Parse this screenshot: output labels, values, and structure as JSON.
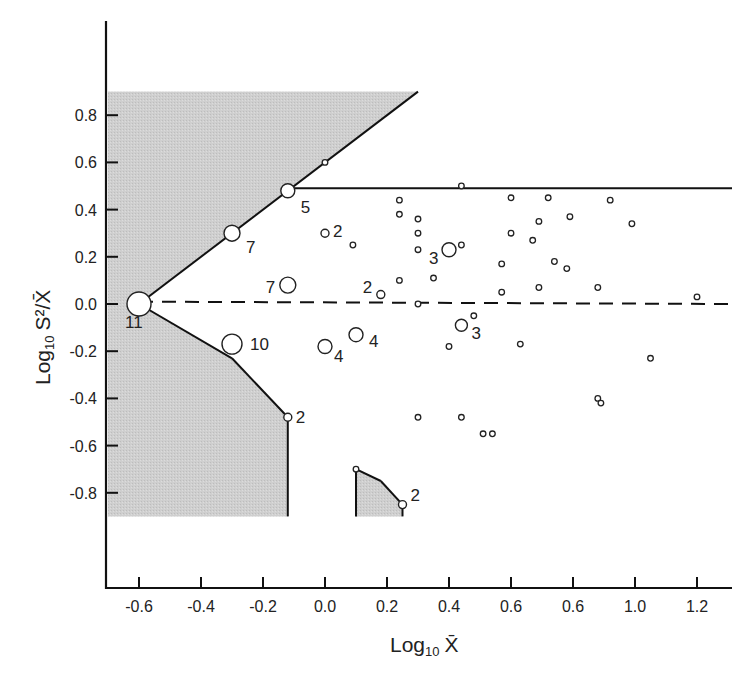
{
  "chart_data": {
    "type": "scatter",
    "title": "",
    "xlabel": "Log10 X̄",
    "ylabel": "Log10 S²/X̄",
    "xlabel_parts": {
      "main": "Log",
      "sub": "10",
      "var": "X̄"
    },
    "ylabel_parts": {
      "main": "Log",
      "sub": "10",
      "var": "S²/X̄"
    },
    "xlim": [
      -0.7,
      1.32
    ],
    "ylim": [
      -0.9,
      0.9
    ],
    "grid": false,
    "legend": "none",
    "x_ticks": [
      {
        "value": -0.6,
        "label": "-0.6"
      },
      {
        "value": -0.4,
        "label": "-0.4"
      },
      {
        "value": -0.2,
        "label": "-0.2"
      },
      {
        "value": 0.0,
        "label": "0.0"
      },
      {
        "value": 0.2,
        "label": "0.2"
      },
      {
        "value": 0.4,
        "label": "0.4"
      },
      {
        "value": 0.6,
        "label": "0.6"
      },
      {
        "value": 0.8,
        "label": "0.6"
      },
      {
        "value": 1.0,
        "label": "1.0"
      },
      {
        "value": 1.2,
        "label": "1.2"
      }
    ],
    "y_ticks": [
      {
        "value": 0.8,
        "label": "0.8"
      },
      {
        "value": 0.6,
        "label": "0.6"
      },
      {
        "value": 0.4,
        "label": "0.4"
      },
      {
        "value": 0.2,
        "label": "0.2"
      },
      {
        "value": 0.0,
        "label": "0.0"
      },
      {
        "value": -0.2,
        "label": "-0.2"
      },
      {
        "value": -0.4,
        "label": "-0.4"
      },
      {
        "value": -0.6,
        "label": "-0.6"
      },
      {
        "value": -0.8,
        "label": "-0.8"
      }
    ],
    "reference_lines": [
      {
        "name": "upper-limit-line",
        "style": "solid",
        "from": [
          -0.12,
          0.49
        ],
        "to": [
          1.32,
          0.49
        ]
      },
      {
        "name": "random-dashed-line",
        "style": "dashed",
        "from": [
          -0.6,
          0.01
        ],
        "to": [
          1.32,
          0.0
        ]
      }
    ],
    "shaded_regions": [
      {
        "name": "upper-excluded-region",
        "vertices": [
          [
            -0.7,
            0.9
          ],
          [
            0.3,
            0.9
          ],
          [
            -0.6,
            0.0
          ],
          [
            -0.7,
            0.0
          ]
        ]
      },
      {
        "name": "lower-excluded-region",
        "vertices": [
          [
            -0.7,
            0.0
          ],
          [
            -0.6,
            0.0
          ],
          [
            -0.3,
            -0.23
          ],
          [
            -0.12,
            -0.48
          ],
          [
            -0.12,
            -0.9
          ],
          [
            -0.7,
            -0.9
          ]
        ]
      },
      {
        "name": "small-excluded-region",
        "vertices": [
          [
            0.1,
            -0.7
          ],
          [
            0.18,
            -0.75
          ],
          [
            0.25,
            -0.85
          ],
          [
            0.25,
            -0.9
          ],
          [
            0.1,
            -0.9
          ]
        ]
      }
    ],
    "labeled_points": [
      {
        "x": -0.6,
        "y": 0.0,
        "count": "11",
        "size": 12
      },
      {
        "x": -0.3,
        "y": -0.17,
        "count": "10",
        "size": 10
      },
      {
        "x": -0.3,
        "y": 0.3,
        "count": "7",
        "size": 8
      },
      {
        "x": -0.12,
        "y": 0.48,
        "count": "5",
        "size": 7
      },
      {
        "x": -0.12,
        "y": 0.08,
        "count": "7",
        "size": 8
      },
      {
        "x": -0.12,
        "y": -0.48,
        "count": "2",
        "size": 4
      },
      {
        "x": 0.0,
        "y": -0.18,
        "count": "4",
        "size": 7
      },
      {
        "x": 0.1,
        "y": -0.13,
        "count": "4",
        "size": 7
      },
      {
        "x": 0.4,
        "y": 0.23,
        "count": "3",
        "size": 7
      },
      {
        "x": 0.44,
        "y": -0.09,
        "count": "3",
        "size": 6
      },
      {
        "x": 0.0,
        "y": 0.3,
        "count": "2",
        "size": 4
      },
      {
        "x": 0.18,
        "y": 0.04,
        "count": "2",
        "size": 4
      },
      {
        "x": 0.25,
        "y": -0.85,
        "count": "2",
        "size": 4
      }
    ],
    "single_points": [
      {
        "x": 0.0,
        "y": 0.6
      },
      {
        "x": 0.44,
        "y": 0.5
      },
      {
        "x": 0.1,
        "y": -0.7
      },
      {
        "x": 0.24,
        "y": 0.44
      },
      {
        "x": 0.24,
        "y": 0.38
      },
      {
        "x": 0.3,
        "y": 0.36
      },
      {
        "x": 0.3,
        "y": 0.3
      },
      {
        "x": 0.3,
        "y": 0.23
      },
      {
        "x": 0.09,
        "y": 0.25
      },
      {
        "x": 0.44,
        "y": 0.25
      },
      {
        "x": 0.24,
        "y": 0.1
      },
      {
        "x": 0.35,
        "y": 0.11
      },
      {
        "x": 0.3,
        "y": 0.0
      },
      {
        "x": 0.6,
        "y": 0.45
      },
      {
        "x": 0.72,
        "y": 0.45
      },
      {
        "x": 0.92,
        "y": 0.44
      },
      {
        "x": 0.69,
        "y": 0.35
      },
      {
        "x": 0.6,
        "y": 0.3
      },
      {
        "x": 0.79,
        "y": 0.37
      },
      {
        "x": 0.99,
        "y": 0.34
      },
      {
        "x": 0.67,
        "y": 0.27
      },
      {
        "x": 0.57,
        "y": 0.17
      },
      {
        "x": 0.74,
        "y": 0.18
      },
      {
        "x": 0.78,
        "y": 0.15
      },
      {
        "x": 0.57,
        "y": 0.05
      },
      {
        "x": 0.69,
        "y": 0.07
      },
      {
        "x": 0.88,
        "y": 0.07
      },
      {
        "x": 1.2,
        "y": 0.03
      },
      {
        "x": 0.48,
        "y": -0.05
      },
      {
        "x": 0.4,
        "y": -0.18
      },
      {
        "x": 0.63,
        "y": -0.17
      },
      {
        "x": 1.05,
        "y": -0.23
      },
      {
        "x": 0.88,
        "y": -0.4
      },
      {
        "x": 0.89,
        "y": -0.42
      },
      {
        "x": 0.3,
        "y": -0.48
      },
      {
        "x": 0.44,
        "y": -0.48
      },
      {
        "x": 0.51,
        "y": -0.55
      },
      {
        "x": 0.54,
        "y": -0.55
      }
    ]
  }
}
